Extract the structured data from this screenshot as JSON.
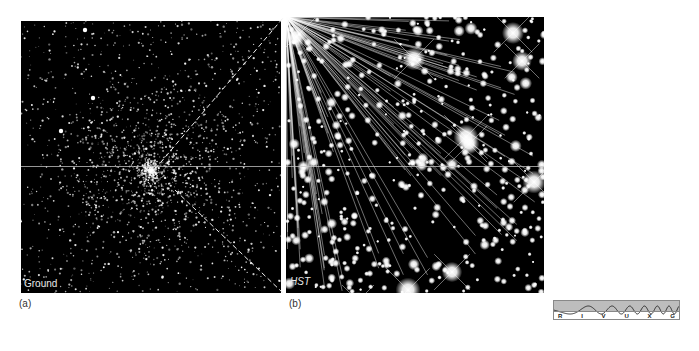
{
  "figure": {
    "panel_a": {
      "label": "Ground",
      "caption": "(a)"
    },
    "panel_b": {
      "label": "HST",
      "caption": "(b)"
    },
    "spectrum_bar": {
      "bands": [
        "R",
        "I",
        "V",
        "U",
        "X",
        "G"
      ],
      "highlight_color": "#bdbdbd"
    },
    "colors": {
      "background": "#ffffff",
      "sky": "#000000",
      "star": "#ffffff"
    }
  }
}
